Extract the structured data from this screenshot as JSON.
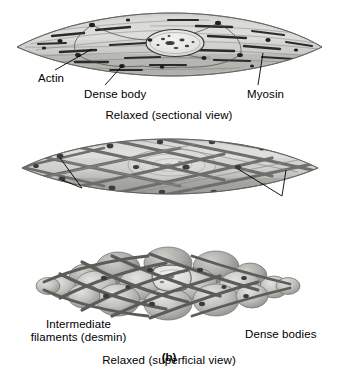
{
  "figure": {
    "figure_label": "(b)",
    "panels": [
      {
        "id": "relaxed-sectional",
        "caption": "Relaxed (sectional view)",
        "labels": [
          {
            "id": "actin",
            "text": "Actin"
          },
          {
            "id": "dense-body",
            "text": "Dense body"
          },
          {
            "id": "myosin",
            "text": "Myosin"
          }
        ]
      },
      {
        "id": "relaxed-superficial",
        "caption": "Relaxed (superficial view)",
        "labels": [
          {
            "id": "intermediate-filaments",
            "text": "Intermediate\nfilaments (desmin)"
          },
          {
            "id": "dense-bodies",
            "text": "Dense bodies"
          }
        ]
      },
      {
        "id": "contracted-superficial",
        "caption": "Contracted (superficial view)",
        "labels": []
      }
    ]
  },
  "colors": {
    "background": "#ffffff",
    "text": "#000000",
    "leader_line": "#000000",
    "cell_fill_light": "#d8d8d6",
    "cell_fill_mid": "#bdbdba",
    "cell_fill_dark": "#9d9d9a",
    "cell_outline": "#6d6d6a",
    "filament_dark": "#2e2e2e",
    "filament_mid": "#555555",
    "dense_body": "#1f1f1f",
    "lattice_band": "#70706d",
    "nucleus_fill": "#eeeeec",
    "nucleus_outline": "#3a3a38"
  }
}
